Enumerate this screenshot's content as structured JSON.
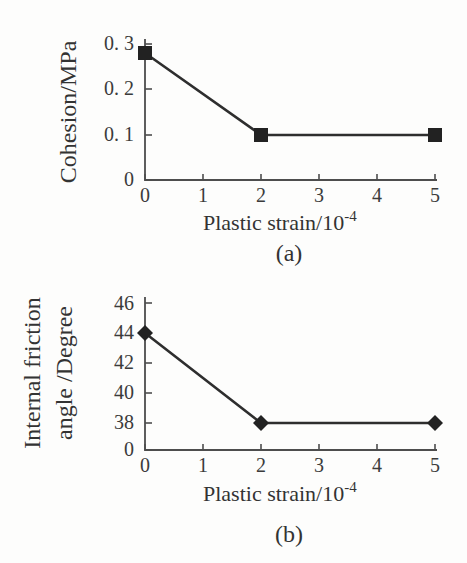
{
  "figure": {
    "background": "#fdfdfc",
    "ink": "#3b3b3b",
    "axis_color": "#4d4d4d",
    "line_color": "#2e2e2e",
    "marker_color": "#222222"
  },
  "chart_data": [
    {
      "id": "a",
      "type": "line",
      "title": "",
      "caption": "(a)",
      "xlabel": "Plastic strain/10",
      "xlabel_superscript": "-4",
      "ylabel": "Cohesion/MPa",
      "ylabel_lines": [
        "Cohesion/MPa"
      ],
      "marker": "square",
      "grid": false,
      "legend": null,
      "xlim": [
        0,
        5
      ],
      "ylim": [
        0,
        0.3
      ],
      "x_ticks": [
        "0",
        "1",
        "2",
        "3",
        "4",
        "5"
      ],
      "x_tick_values": [
        0,
        1,
        2,
        3,
        4,
        5
      ],
      "y_ticks": [
        "0",
        "0. 1",
        "0. 2",
        "0. 3"
      ],
      "y_tick_values": [
        0,
        0.1,
        0.2,
        0.3
      ],
      "series": [
        {
          "name": "cohesion",
          "x": [
            0,
            2,
            5
          ],
          "y": [
            0.28,
            0.1,
            0.1
          ]
        }
      ]
    },
    {
      "id": "b",
      "type": "line",
      "title": "",
      "caption": "(b)",
      "xlabel": "Plastic strain/10",
      "xlabel_superscript": "-4",
      "ylabel": "Internal friction angle /Degree",
      "ylabel_lines": [
        "Internal friction",
        "angle /Degree"
      ],
      "marker": "diamond",
      "grid": false,
      "legend": null,
      "xlim": [
        0,
        5
      ],
      "ylim_note": "broken axis: 0 then 38-46",
      "x_ticks": [
        "0",
        "1",
        "2",
        "3",
        "4",
        "5"
      ],
      "x_tick_values": [
        0,
        1,
        2,
        3,
        4,
        5
      ],
      "y_ticks": [
        "0",
        "38",
        "40",
        "42",
        "44",
        "46"
      ],
      "y_tick_values": [
        0,
        38,
        40,
        42,
        44,
        46
      ],
      "series": [
        {
          "name": "internal-friction-angle",
          "x": [
            0,
            2,
            5
          ],
          "y": [
            44,
            38,
            38
          ]
        }
      ]
    }
  ]
}
